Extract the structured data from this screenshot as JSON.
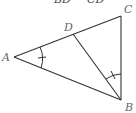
{
  "diagram": {
    "top_text": [
      "BD",
      "CD"
    ],
    "points": {
      "A": {
        "label": "A",
        "x": 14,
        "y": 57
      },
      "B": {
        "label": "B",
        "x": 121,
        "y": 100
      },
      "C": {
        "label": "C",
        "x": 121,
        "y": 16
      },
      "D": {
        "label": "D",
        "x": 73,
        "y": 34
      }
    },
    "segments": [
      "AC",
      "AB",
      "BC",
      "BD"
    ],
    "angle_marks": [
      "angle A (single tick)",
      "angle DBC (single tick)"
    ],
    "stroke_color": "#333333"
  }
}
